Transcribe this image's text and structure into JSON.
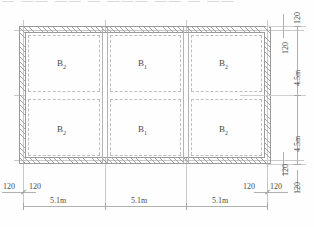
{
  "drawing": {
    "header_text": "— —— —— — ——— —— — ——",
    "type": "structural-floor-plan"
  },
  "panels": {
    "top": [
      {
        "id": "panel-top-left",
        "label": "B",
        "sub": "2"
      },
      {
        "id": "panel-top-mid",
        "label": "B",
        "sub": "1"
      },
      {
        "id": "panel-top-right",
        "label": "B",
        "sub": "2"
      }
    ],
    "bottom": [
      {
        "id": "panel-bottom-left",
        "label": "B",
        "sub": "2"
      },
      {
        "id": "panel-bottom-mid",
        "label": "B",
        "sub": "1"
      },
      {
        "id": "panel-bottom-right",
        "label": "B",
        "sub": "2"
      }
    ]
  },
  "dimensions": {
    "horizontal": {
      "bays": [
        "5.1m",
        "5.1m",
        "5.1m"
      ],
      "left_wall": [
        "120",
        "120"
      ],
      "right_wall": [
        "120",
        "120"
      ]
    },
    "vertical": {
      "bays": [
        "4.5m",
        "4.5m"
      ],
      "top_wall": [
        "120",
        "120"
      ],
      "bottom_wall": [
        "120",
        "120"
      ],
      "far_right_top": "120",
      "far_right_bottom": "120"
    }
  },
  "colors": {
    "line": "#b4b4b4",
    "wall_hatch": "#969696",
    "text": "#4a4a4a",
    "background": "#fefefe"
  }
}
